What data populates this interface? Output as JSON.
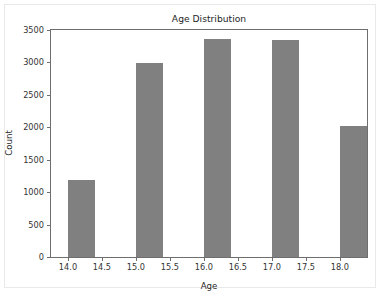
{
  "chart_data": {
    "type": "bar",
    "title": "Age Distribution",
    "xlabel": "Age",
    "ylabel": "Count",
    "categories": [
      "14.0",
      "15.0",
      "16.0",
      "17.0",
      "18.0"
    ],
    "x": [
      14.0,
      15.0,
      16.0,
      17.0,
      18.0
    ],
    "values": [
      1190,
      2985,
      3360,
      3340,
      2020
    ],
    "bar_width": 0.4,
    "bar_color": "#808080",
    "xlim": [
      13.75,
      18.4
    ],
    "ylim": [
      0,
      3500
    ],
    "xticks": [
      14.0,
      14.5,
      15.0,
      15.5,
      16.0,
      16.5,
      17.0,
      17.5,
      18.0
    ],
    "xtick_labels": [
      "14.0",
      "14.5",
      "15.0",
      "15.5",
      "16.0",
      "16.5",
      "17.0",
      "17.5",
      "18.0"
    ],
    "yticks": [
      0,
      500,
      1000,
      1500,
      2000,
      2500,
      3000,
      3500
    ],
    "ytick_labels": [
      "0",
      "500",
      "1000",
      "1500",
      "2000",
      "2500",
      "3000",
      "3500"
    ],
    "grid": false,
    "legend": null,
    "background_color": "#ffffff",
    "frame_color": "#6e6e6e"
  }
}
